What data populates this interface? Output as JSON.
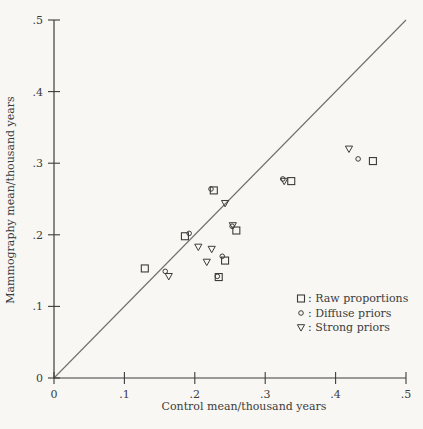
{
  "figure": {
    "paper_color": "#f8f7f3",
    "ink_color": "#3c3c3c",
    "diagonal_color": "#6f6f6f"
  },
  "chart_data": {
    "type": "scatter",
    "title": "",
    "xlabel": "Control mean/thousand years",
    "ylabel": "Mammography mean/thousand years",
    "xlim": [
      0,
      0.5
    ],
    "ylim": [
      0,
      0.5
    ],
    "xticks": [
      0,
      0.1,
      0.2,
      0.3,
      0.4,
      0.5
    ],
    "yticks": [
      0,
      0.1,
      0.2,
      0.3,
      0.4,
      0.5
    ],
    "xtick_labels": [
      "0",
      ".1",
      ".2",
      ".3",
      ".4",
      ".5"
    ],
    "ytick_labels": [
      "0",
      ".1",
      ".2",
      ".3",
      ".4",
      ".5"
    ],
    "grid": false,
    "identity_line": {
      "from": [
        0,
        0
      ],
      "to": [
        0.5,
        0.5
      ]
    },
    "legend": {
      "position": "lower-right",
      "separator": ":",
      "items": [
        {
          "marker": "square",
          "label": "Raw proportions"
        },
        {
          "marker": "circle",
          "label": "Diffuse priors"
        },
        {
          "marker": "triangle-down",
          "label": "Strong priors"
        }
      ]
    },
    "series": [
      {
        "name": "Raw proportions",
        "marker": "square",
        "points": [
          [
            0.227,
            0.262
          ],
          [
            0.259,
            0.206
          ],
          [
            0.186,
            0.198
          ],
          [
            0.243,
            0.164
          ],
          [
            0.129,
            0.153
          ],
          [
            0.234,
            0.141
          ],
          [
            0.337,
            0.275
          ],
          [
            0.453,
            0.303
          ]
        ]
      },
      {
        "name": "Diffuse priors",
        "marker": "circle",
        "points": [
          [
            0.223,
            0.264
          ],
          [
            0.253,
            0.212
          ],
          [
            0.192,
            0.202
          ],
          [
            0.239,
            0.17
          ],
          [
            0.158,
            0.149
          ],
          [
            0.232,
            0.142
          ],
          [
            0.325,
            0.278
          ],
          [
            0.432,
            0.306
          ]
        ]
      },
      {
        "name": "Strong priors",
        "marker": "triangle-down",
        "points": [
          [
            0.243,
            0.244
          ],
          [
            0.254,
            0.213
          ],
          [
            0.205,
            0.183
          ],
          [
            0.224,
            0.18
          ],
          [
            0.163,
            0.142
          ],
          [
            0.217,
            0.162
          ],
          [
            0.327,
            0.275
          ],
          [
            0.419,
            0.32
          ]
        ]
      }
    ]
  }
}
